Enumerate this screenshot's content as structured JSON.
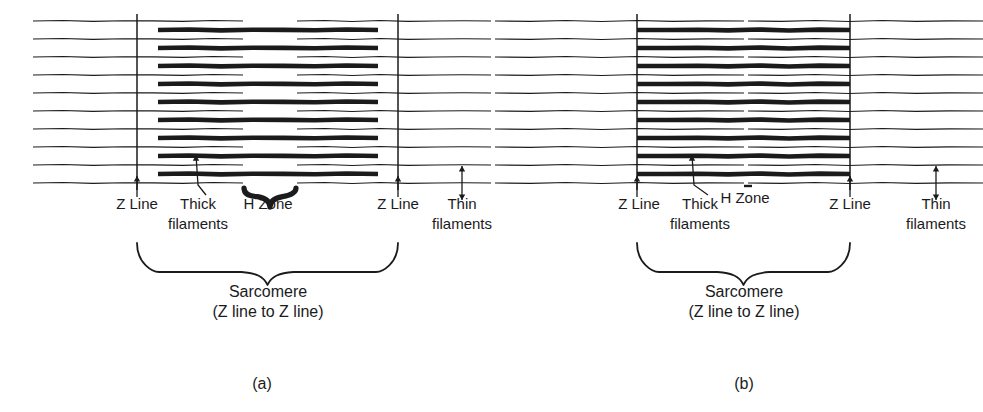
{
  "figure": {
    "type": "diagram",
    "background_color": "#ffffff",
    "ink_color": "#1b1b1b",
    "width": 983,
    "height": 412
  },
  "panels": [
    {
      "id": "a",
      "letter": "(a)",
      "state": "relaxed",
      "letter_x": 262,
      "letter_y": 389,
      "geometry": {
        "z_line_left_x": 137,
        "z_line_right_x": 398,
        "thick_start_x": 158,
        "thick_end_x": 378,
        "thin_row_start_x": 33,
        "thin_row_end_x": 491,
        "h_zone_start_x": 245,
        "h_zone_end_x": 295,
        "thin_gap_start_x": 243,
        "thin_gap_end_x": 297,
        "field_top_y": 14,
        "field_bottom_y": 190,
        "row_pitch": 18,
        "thin_row_count": 10,
        "thick_row_count": 9
      },
      "labels": {
        "z_line_left": "Z Line",
        "z_line_right": "Z Line",
        "thick": "Thick",
        "thick_second": "filaments",
        "h_zone": "H Zone",
        "thin": "Thin",
        "thin_second": "filaments",
        "sarcomere": "Sarcomere",
        "sarcomere_sub": "(Z line to Z line)"
      },
      "label_positions": {
        "z_line_left_x": 137,
        "z_line_left_y": 209,
        "z_line_right_x": 398,
        "z_line_right_y": 209,
        "thick_x": 198,
        "thick_y": 209,
        "thick_second_x": 198,
        "thick_second_y": 229,
        "h_zone_x": 268,
        "h_zone_y": 209,
        "thin_x": 462,
        "thin_y": 209,
        "thin_second_x": 462,
        "thin_second_y": 229,
        "sarcomere_x": 268,
        "sarcomere_y": 297,
        "sarcomere_sub_x": 268,
        "sarcomere_sub_y": 317
      },
      "arrows": {
        "z_left": {
          "x": 137,
          "y_tip": 176,
          "y_tail": 197
        },
        "z_right": {
          "x": 398,
          "y_tip": 176,
          "y_tail": 197
        },
        "thick_pointer_tip_x": 196,
        "thick_pointer_tip_y": 155,
        "thin_double": {
          "x": 462,
          "y_top": 166,
          "y_bottom": 200
        }
      },
      "h_zone_brace": {
        "x1": 244,
        "x2": 296,
        "y": 188,
        "depth": 11
      },
      "sarcomere_brace": {
        "x1": 137,
        "x2": 398,
        "y_top": 243,
        "y_body": 272,
        "tip_y": 285
      }
    },
    {
      "id": "b",
      "letter": "(b)",
      "state": "contracted",
      "letter_x": 744,
      "letter_y": 389,
      "geometry": {
        "z_line_left_x": 637,
        "z_line_right_x": 850,
        "thick_start_x": 637,
        "thick_end_x": 850,
        "thin_row_start_x": 495,
        "thin_row_end_x": 983,
        "h_zone_start_x": 740,
        "h_zone_end_x": 748,
        "thin_gap_start_x": 744,
        "thin_gap_end_x": 748,
        "field_top_y": 14,
        "field_bottom_y": 190,
        "row_pitch": 18,
        "thin_row_count": 10,
        "thick_row_count": 9
      },
      "labels": {
        "z_line_left": "Z Line",
        "z_line_right": "Z Line",
        "thick": "Thick",
        "thick_second": "filaments",
        "h_zone": "H Zone",
        "thin": "Thin",
        "thin_second": "filaments",
        "sarcomere": "Sarcomere",
        "sarcomere_sub": "(Z line to Z line)"
      },
      "label_positions": {
        "z_line_left_x": 639,
        "z_line_left_y": 209,
        "z_line_right_x": 850,
        "z_line_right_y": 209,
        "thick_x": 700,
        "thick_y": 209,
        "thick_second_x": 700,
        "thick_second_y": 229,
        "h_zone_x": 745,
        "h_zone_y": 203,
        "thin_x": 936,
        "thin_y": 209,
        "thin_second_x": 936,
        "thin_second_y": 229,
        "sarcomere_x": 744,
        "sarcomere_y": 297,
        "sarcomere_sub_x": 744,
        "sarcomere_sub_y": 317
      },
      "arrows": {
        "z_left": {
          "x": 637,
          "y_tip": 176,
          "y_tail": 197
        },
        "z_right": {
          "x": 850,
          "y_tip": 176,
          "y_tail": 197
        },
        "thick_pointer_tip_x": 692,
        "thick_pointer_tip_y": 155,
        "thin_double": {
          "x": 936,
          "y_top": 166,
          "y_bottom": 200
        }
      },
      "h_zone_brace": null,
      "h_zone_tick": {
        "x": 748,
        "y": 186
      },
      "sarcomere_brace": {
        "x1": 637,
        "x2": 850,
        "y_top": 243,
        "y_body": 272,
        "tip_y": 285
      }
    }
  ]
}
